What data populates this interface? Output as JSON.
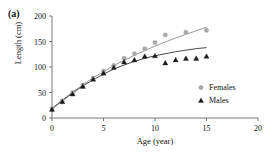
{
  "figure": {
    "panel_label": "(a)"
  },
  "chart_data": {
    "type": "scatter",
    "title": "",
    "xlabel": "Age (year)",
    "ylabel": "Length (cm)",
    "xlim": [
      0,
      20
    ],
    "ylim": [
      0,
      200
    ],
    "xticks": [
      0,
      5,
      10,
      15,
      20
    ],
    "yticks": [
      0,
      50,
      100,
      150,
      200
    ],
    "grid": false,
    "legend_position": "right-middle",
    "series": [
      {
        "name": "Females",
        "marker": "circle",
        "color": "#a8a8a8",
        "x": [
          0,
          1,
          2,
          3,
          4,
          5,
          6,
          7,
          8,
          9,
          10,
          11,
          13,
          15
        ],
        "values": [
          18,
          34,
          50,
          65,
          78,
          92,
          103,
          117,
          126,
          136,
          148,
          163,
          168,
          172
        ]
      },
      {
        "name": "Males",
        "marker": "triangle",
        "color": "#1a1a1a",
        "x": [
          0,
          1,
          2,
          3,
          4,
          5,
          6,
          7,
          8,
          9,
          10,
          11,
          12,
          13,
          14,
          15
        ],
        "values": [
          17,
          32,
          47,
          62,
          76,
          88,
          99,
          110,
          114,
          121,
          122,
          108,
          114,
          117,
          117,
          121
        ]
      }
    ],
    "fitted_curves": [
      {
        "name": "Females fit",
        "color": "#8c8c8c",
        "x": [
          0,
          1,
          2,
          3,
          4,
          5,
          6,
          7,
          8,
          9,
          10,
          11,
          12,
          13,
          14,
          15
        ],
        "values": [
          19,
          35,
          51,
          65,
          79,
          91,
          103,
          113,
          123,
          132,
          141,
          149,
          157,
          164,
          171,
          178
        ]
      },
      {
        "name": "Males fit",
        "color": "#333333",
        "x": [
          0,
          1,
          2,
          3,
          4,
          5,
          6,
          7,
          8,
          9,
          10,
          11,
          12,
          13,
          14,
          15
        ],
        "values": [
          18,
          34,
          49,
          63,
          75,
          86,
          96,
          104,
          111,
          117,
          122,
          126,
          130,
          133,
          136,
          138
        ]
      }
    ]
  },
  "legend": {
    "entries": [
      {
        "label": "Females",
        "marker": "circle",
        "color": "#a8a8a8"
      },
      {
        "label": "Males",
        "marker": "triangle",
        "color": "#1a1a1a"
      }
    ]
  }
}
